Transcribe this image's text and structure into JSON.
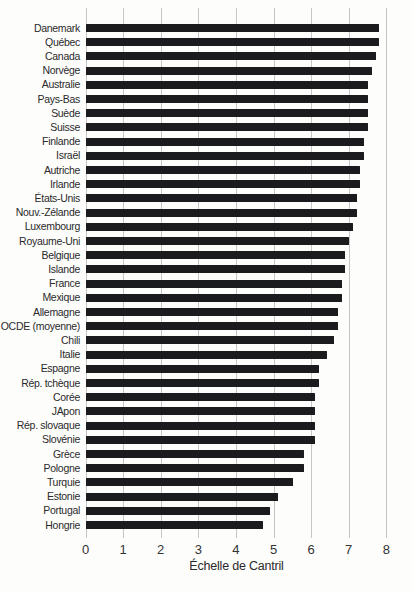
{
  "chart_data": {
    "type": "bar",
    "orientation": "horizontal",
    "title": "",
    "xlabel": "Échelle de Cantril",
    "ylabel": "",
    "xlim": [
      0,
      8
    ],
    "xticks": [
      "0",
      "1",
      "2",
      "3",
      "4",
      "5",
      "6",
      "7",
      "8"
    ],
    "grid": "vertical",
    "legend": "none",
    "bar_color": "#1b1b1d",
    "gridline_color": "#c6c6c6",
    "background_color": "#fdfdfc",
    "categories": [
      "Danemark",
      "Québec",
      "Canada",
      "Norvège",
      "Australie",
      "Pays-Bas",
      "Suède",
      "Suisse",
      "Finlande",
      "Israël",
      "Autriche",
      "Irlande",
      "États-Unis",
      "Nouv.-Zélande",
      "Luxembourg",
      "Royaume-Uni",
      "Belgique",
      "Islande",
      "France",
      "Mexique",
      "Allemagne",
      "OCDE (moyenne)",
      "Chili",
      "Italie",
      "Espagne",
      "Rép. tchèque",
      "Corée",
      "JApon",
      "Rép. slovaque",
      "Slovénie",
      "Grèce",
      "Pologne",
      "Turquie",
      "Estonie",
      "Portugal",
      "Hongrie"
    ],
    "values": [
      7.8,
      7.8,
      7.7,
      7.6,
      7.5,
      7.5,
      7.5,
      7.5,
      7.4,
      7.4,
      7.3,
      7.3,
      7.2,
      7.2,
      7.1,
      7.0,
      6.9,
      6.9,
      6.8,
      6.8,
      6.7,
      6.7,
      6.6,
      6.4,
      6.2,
      6.2,
      6.1,
      6.1,
      6.1,
      6.1,
      5.8,
      5.8,
      5.5,
      5.1,
      4.9,
      4.7
    ]
  }
}
